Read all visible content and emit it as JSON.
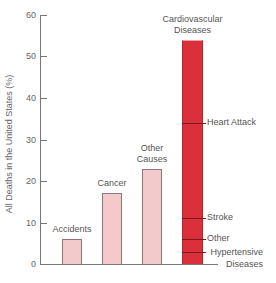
{
  "chart_data": {
    "type": "bar",
    "title": "",
    "xlabel": "",
    "ylabel": "All Deaths in the United States (%)",
    "ylim": [
      0,
      60
    ],
    "yticks": [
      0,
      10,
      20,
      30,
      40,
      50,
      60
    ],
    "ytick_labels": [
      "0",
      "10",
      "20",
      "30",
      "40",
      "50",
      "60"
    ],
    "grid": false,
    "legend": null,
    "categories": [
      "Accidents",
      "Cancer",
      "Other Causes",
      "Cardiovascular Diseases"
    ],
    "bar_labels": [
      "Accidents",
      "Cancer",
      "Other\nCauses",
      "Cardiovascular\nDiseases"
    ],
    "values": [
      6,
      17,
      23,
      54
    ],
    "annotations": [
      {
        "bar": "Cardiovascular Diseases",
        "label": "Heart Attack",
        "y": 34
      },
      {
        "bar": "Cardiovascular Diseases",
        "label": "Stroke",
        "y": 11
      },
      {
        "bar": "Cardiovascular Diseases",
        "label": "Other",
        "y": 6
      },
      {
        "bar": "Cardiovascular Diseases",
        "label": "Hypertensive\nDiseases",
        "y": 3
      }
    ],
    "colors": {
      "light_bar": "#f4c9cc",
      "dark_bar": "#d9303b",
      "marker_line": "#7a1518",
      "axis": "#777777",
      "text": "#555555"
    }
  }
}
